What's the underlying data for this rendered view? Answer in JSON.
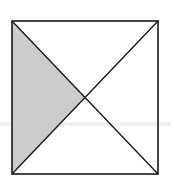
{
  "diagram": {
    "type": "geometry",
    "square": {
      "x1": 12,
      "y1": 21,
      "x2": 158,
      "y2": 174
    },
    "center": {
      "x": 85,
      "y": 97.5
    },
    "shaded_region": "left-triangle",
    "colors": {
      "stroke": "#1a1a1a",
      "fill_shaded": "#cccccc",
      "background": "#ffffff"
    }
  }
}
